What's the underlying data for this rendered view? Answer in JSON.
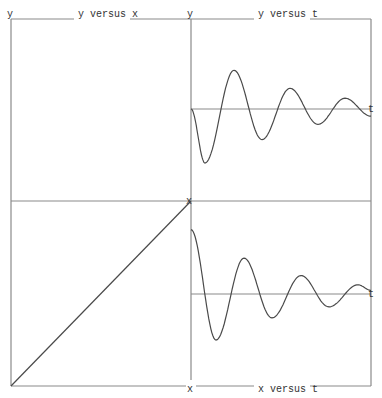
{
  "chart_data": [
    {
      "id": "y-vs-x",
      "type": "line",
      "title": "y versus x",
      "xlabel": "x",
      "ylabel": "y",
      "xlim": [
        0,
        1
      ],
      "ylim": [
        0,
        1
      ],
      "grid": false,
      "series": [
        {
          "name": "y vs x",
          "x": [
            0,
            1
          ],
          "y": [
            0,
            1
          ]
        }
      ]
    },
    {
      "id": "y-vs-t",
      "type": "line",
      "title": "y versus t",
      "xlabel": "t",
      "ylabel": "y",
      "xlim": [
        0,
        180
      ],
      "ylim": [
        -1,
        1
      ],
      "grid": false,
      "series": [
        {
          "name": "y(t)",
          "t": [
            0,
            14,
            43,
            71,
            99,
            127,
            154,
            180
          ],
          "y": [
            0,
            -0.6,
            0.43,
            -0.34,
            0.23,
            -0.17,
            0.12,
            -0.08
          ]
        }
      ]
    },
    {
      "id": "x-vs-t",
      "type": "line",
      "title": "x versus t",
      "xlabel": "t",
      "ylabel": "x",
      "xlim": [
        0,
        180
      ],
      "ylim": [
        -1,
        1
      ],
      "grid": false,
      "series": [
        {
          "name": "x(t)",
          "t": [
            0,
            25,
            53,
            81,
            110,
            138,
            167,
            180
          ],
          "x": [
            0.7,
            -0.5,
            0.39,
            -0.26,
            0.2,
            -0.14,
            0.1,
            0.04
          ]
        }
      ]
    }
  ],
  "labels": {
    "top_left_y": "y",
    "top_mid_y": "y",
    "top_left_title": "y versus x",
    "top_right_title": "y versus t",
    "right_t_top": "t",
    "right_t_bottom": "t",
    "mid_x": "x",
    "bottom_x": "x",
    "bottom_title": "x versus t"
  }
}
